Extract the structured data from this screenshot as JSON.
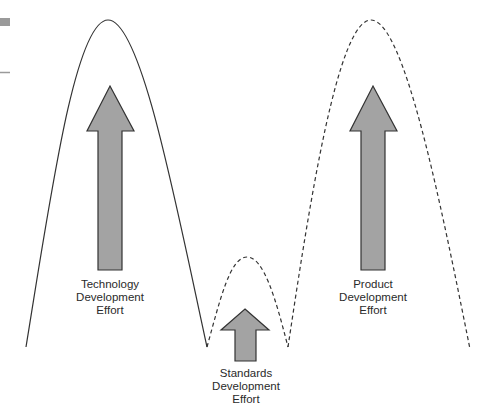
{
  "diagram": {
    "colors": {
      "background": "#ffffff",
      "curve_stroke": "#333333",
      "arrow_fill": "#a3a3a3",
      "arrow_stroke": "#333333",
      "margin_marks": "#9a9a9a",
      "text": "#2a2a2a"
    },
    "phases": [
      {
        "id": "technology",
        "curve_style": "solid",
        "label_lines": [
          "Technology",
          "Development",
          "Effort"
        ]
      },
      {
        "id": "standards",
        "curve_style": "dashed",
        "label_lines": [
          "Standards",
          "Development",
          "Effort"
        ]
      },
      {
        "id": "product",
        "curve_style": "dashed",
        "label_lines": [
          "Product",
          "Development",
          "Effort"
        ]
      }
    ]
  }
}
